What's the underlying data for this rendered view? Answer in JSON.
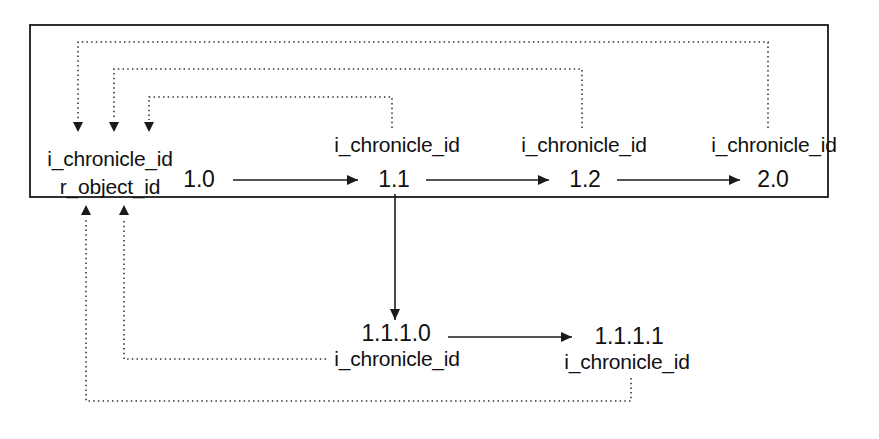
{
  "diagram": {
    "type": "version-tree",
    "nodes": [
      {
        "id": "v1_0",
        "version": "1.0",
        "labels": [
          "i_chronicle_id",
          "r_object_id"
        ]
      },
      {
        "id": "v1_1",
        "version": "1.1",
        "label": "i_chronicle_id"
      },
      {
        "id": "v1_2",
        "version": "1.2",
        "label": "i_chronicle_id"
      },
      {
        "id": "v2_0",
        "version": "2.0",
        "label": "i_chronicle_id"
      },
      {
        "id": "v1_1_1_0",
        "version": "1.1.1.0",
        "label": "i_chronicle_id"
      },
      {
        "id": "v1_1_1_1",
        "version": "1.1.1.1",
        "label": "i_chronicle_id"
      }
    ],
    "edges": [
      {
        "from": "1.0",
        "to": "1.1",
        "style": "solid"
      },
      {
        "from": "1.1",
        "to": "1.2",
        "style": "solid"
      },
      {
        "from": "1.2",
        "to": "2.0",
        "style": "solid"
      },
      {
        "from": "1.1",
        "to": "1.1.1.0",
        "style": "solid"
      },
      {
        "from": "1.1.1.0",
        "to": "1.1.1.1",
        "style": "solid"
      },
      {
        "from": "1.1",
        "to": "1.0",
        "style": "dotted",
        "meaning": "i_chronicle_id references r_object_id of 1.0"
      },
      {
        "from": "1.2",
        "to": "1.0",
        "style": "dotted"
      },
      {
        "from": "2.0",
        "to": "1.0",
        "style": "dotted"
      },
      {
        "from": "1.1.1.0",
        "to": "1.0",
        "style": "dotted"
      },
      {
        "from": "1.1.1.1",
        "to": "1.0",
        "style": "dotted"
      }
    ]
  },
  "colors": {
    "line": "#1a1a1a",
    "background": "#ffffff"
  }
}
